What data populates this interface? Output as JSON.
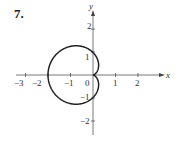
{
  "problem_number": "7.",
  "chart_data": {
    "type": "line",
    "title": "",
    "equation_inferred": "r = 1 - cos(theta)",
    "xlabel": "x",
    "ylabel": "y",
    "x_ticks": [
      -3,
      -2,
      -1,
      0,
      1,
      2
    ],
    "y_ticks": [
      2,
      1,
      -1,
      -2
    ],
    "xlim": [
      -3.3,
      2.9
    ],
    "ylim": [
      -2.4,
      2.7
    ],
    "grid": false,
    "key_points": [
      {
        "x": 0,
        "y": 0,
        "note": "cusp"
      },
      {
        "x": -2,
        "y": 0,
        "note": "leftmost point"
      },
      {
        "x": 0,
        "y": 1
      },
      {
        "x": 0,
        "y": -1
      },
      {
        "x": -0.75,
        "y": 1.3
      },
      {
        "x": -0.75,
        "y": -1.3
      }
    ]
  }
}
